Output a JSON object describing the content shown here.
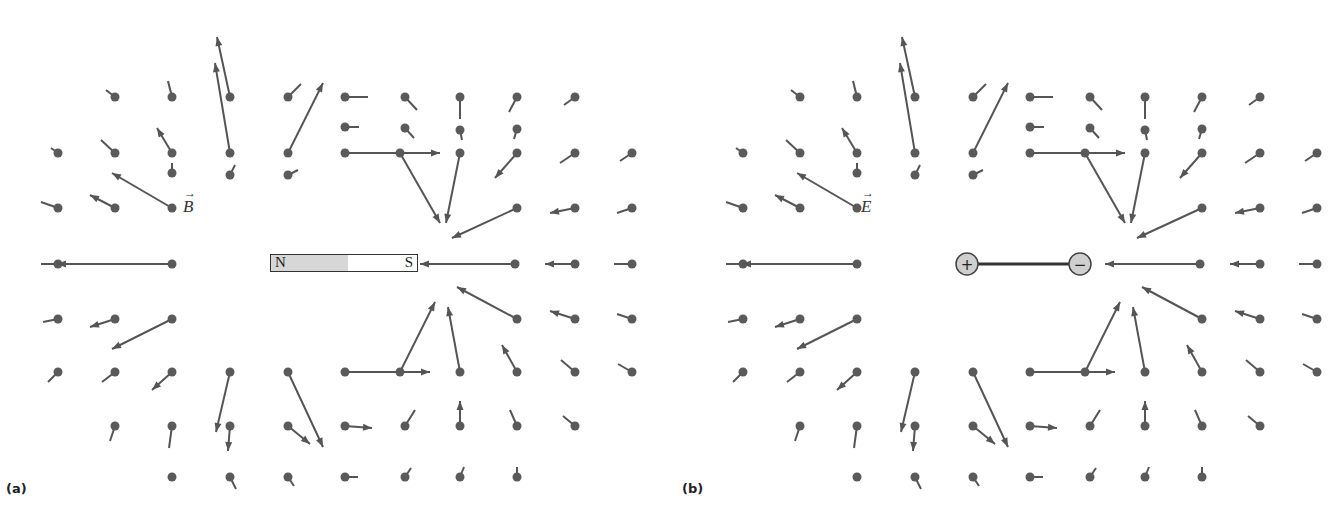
{
  "figure": {
    "panels": [
      {
        "id": "a",
        "label": "(a)",
        "field_symbol": "B",
        "source": "bar-magnet",
        "magnet": {
          "north_label": "N",
          "south_label": "S"
        }
      },
      {
        "id": "b",
        "label": "(b)",
        "field_symbol": "E",
        "source": "electric-dipole",
        "dipole": {
          "positive_label": "+",
          "negative_label": "−"
        }
      }
    ],
    "colors": {
      "vector": "#555555",
      "dot": "#5a5a5a",
      "magnet_north_fill": "#d7d7d7",
      "charge_fill": "#cfcfcf"
    },
    "vector_field_a": [
      [
        172,
        173,
        0,
        -10
      ],
      [
        230,
        175,
        5,
        -10
      ],
      [
        288,
        175,
        10,
        -5
      ],
      [
        345,
        127,
        14,
        0
      ],
      [
        405,
        128,
        9,
        10
      ],
      [
        460,
        130,
        2,
        10
      ],
      [
        517,
        129,
        -3,
        10
      ],
      [
        115,
        97,
        -9,
        -7
      ],
      [
        172,
        97,
        -4,
        -16
      ],
      [
        230,
        97,
        -13,
        -60
      ],
      [
        288,
        97,
        13,
        -13
      ],
      [
        345,
        97,
        23,
        0
      ],
      [
        405,
        97,
        12,
        13
      ],
      [
        460,
        97,
        0,
        22
      ],
      [
        517,
        97,
        -8,
        15
      ],
      [
        575,
        97,
        -11,
        8
      ],
      [
        58,
        153,
        -7,
        -5
      ],
      [
        115,
        153,
        -14,
        -13
      ],
      [
        172,
        153,
        -15,
        -25
      ],
      [
        230,
        153,
        -15,
        -90
      ],
      [
        288,
        153,
        35,
        -70
      ],
      [
        345,
        153,
        95,
        0
      ],
      [
        400,
        153,
        40,
        70
      ],
      [
        460,
        153,
        -14,
        70
      ],
      [
        517,
        153,
        -22,
        25
      ],
      [
        575,
        153,
        -15,
        10
      ],
      [
        632,
        153,
        -12,
        8
      ],
      [
        58,
        208,
        -17,
        -6
      ],
      [
        115,
        208,
        -25,
        -13
      ],
      [
        172,
        208,
        -60,
        -35
      ],
      [
        517,
        208,
        -65,
        30
      ],
      [
        575,
        208,
        -25,
        5
      ],
      [
        632,
        208,
        -15,
        5
      ],
      [
        58,
        264,
        -17,
        0
      ],
      [
        172,
        264,
        -115,
        0
      ],
      [
        515,
        264,
        -95,
        0
      ],
      [
        575,
        264,
        -30,
        0
      ],
      [
        632,
        264,
        -18,
        0
      ],
      [
        58,
        319,
        -15,
        3
      ],
      [
        115,
        319,
        -25,
        8
      ],
      [
        172,
        319,
        -60,
        30
      ],
      [
        517,
        319,
        -60,
        -32
      ],
      [
        575,
        319,
        -25,
        -8
      ],
      [
        632,
        319,
        -15,
        -5
      ],
      [
        58,
        372,
        -10,
        10
      ],
      [
        115,
        372,
        -13,
        10
      ],
      [
        172,
        372,
        -20,
        18
      ],
      [
        230,
        372,
        -14,
        60
      ],
      [
        288,
        372,
        35,
        75
      ],
      [
        345,
        372,
        85,
        0
      ],
      [
        400,
        372,
        35,
        -70
      ],
      [
        460,
        372,
        -12,
        -65
      ],
      [
        517,
        372,
        -15,
        -27
      ],
      [
        575,
        372,
        -14,
        -12
      ],
      [
        632,
        372,
        -14,
        -8
      ],
      [
        115,
        426,
        -5,
        15
      ],
      [
        172,
        426,
        -3,
        22
      ],
      [
        230,
        426,
        -2,
        25
      ],
      [
        288,
        426,
        22,
        18
      ],
      [
        345,
        426,
        27,
        2
      ],
      [
        405,
        426,
        10,
        -16
      ],
      [
        460,
        426,
        0,
        -25
      ],
      [
        517,
        426,
        -7,
        -16
      ],
      [
        575,
        426,
        -12,
        -10
      ],
      [
        172,
        477,
        0,
        0
      ],
      [
        230,
        477,
        6,
        12
      ],
      [
        288,
        477,
        6,
        9
      ],
      [
        345,
        477,
        13,
        0
      ],
      [
        405,
        477,
        6,
        -9
      ],
      [
        460,
        477,
        4,
        -10
      ],
      [
        517,
        477,
        0,
        -10
      ]
    ]
  }
}
